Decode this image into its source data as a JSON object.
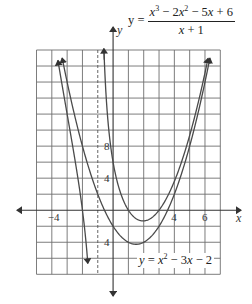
{
  "chart_data": {
    "type": "line",
    "title": "",
    "xlabel": "x",
    "ylabel": "y",
    "xlim": [
      -5,
      7
    ],
    "ylim": [
      -8,
      20
    ],
    "grid": true,
    "x_grid_step": 1,
    "y_grid_step": 2,
    "x_ticks": [
      {
        "value": -4,
        "label": "−4"
      },
      {
        "value": 4,
        "label": "4"
      },
      {
        "value": 6,
        "label": "6"
      }
    ],
    "y_ticks": [
      {
        "value": 8,
        "label": "8"
      },
      {
        "value": 4,
        "label": "4"
      },
      {
        "value": -4,
        "label": "4"
      }
    ],
    "asymptotes": [
      {
        "type": "vertical",
        "x": -1,
        "style": "dashed"
      }
    ],
    "series": [
      {
        "name": "y = (x^3 - 2x^2 - 5x + 6)/(x + 1)",
        "expression": "(x^3-2x^2-5x+6)/(x+1)",
        "branches": [
          [
            -3.6,
            -1.65
          ],
          [
            -0.6,
            6.2
          ]
        ],
        "arrow_ends": true
      },
      {
        "name": "y = x^2 - 3x - 2",
        "expression": "x^2-3x-2",
        "branches": [
          [
            -3.32,
            6.32
          ]
        ],
        "arrow_ends": true
      }
    ],
    "annotations": [
      {
        "text": "y = (x^3 - 2x^2 - 5x + 6)/(x + 1)",
        "position": "top-right"
      },
      {
        "text": "y = x^2 - 3x - 2",
        "position": "lower-right near vertex"
      }
    ]
  },
  "labels": {
    "x_axis": "x",
    "y_axis": "y",
    "rational_eq": {
      "lhs": "y =",
      "num_a": "x",
      "num_a_exp": "3",
      "num_b": " − 2",
      "num_c": "x",
      "num_c_exp": "2",
      "num_d": " − 5",
      "num_e": "x",
      "num_f": " + 6",
      "den_a": "x",
      "den_b": " + 1"
    },
    "parabola_eq": {
      "lhs": "y",
      "eq": " = ",
      "a": "x",
      "a_exp": "2",
      "b": " − 3",
      "c": "x",
      "d": " − 2"
    }
  }
}
